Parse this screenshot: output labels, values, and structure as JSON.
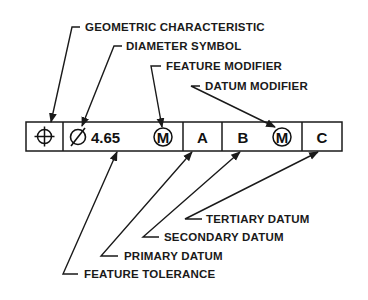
{
  "diagram": {
    "frame": {
      "cells": [
        {
          "id": "geometric-characteristic",
          "symbol": "position-icon",
          "text": ""
        },
        {
          "id": "tolerance",
          "diameter_symbol": "⌀",
          "value": "4.65",
          "modifier": "M"
        },
        {
          "id": "primary-datum",
          "text": "A"
        },
        {
          "id": "secondary-datum",
          "text": "B",
          "modifier": "M"
        },
        {
          "id": "tertiary-datum",
          "text": "C"
        }
      ]
    },
    "labels_top": {
      "geometric_characteristic": "GEOMETRIC CHARACTERISTIC",
      "diameter_symbol": "DIAMETER SYMBOL",
      "feature_modifier": "FEATURE MODIFIER",
      "datum_modifier": "DATUM MODIFIER"
    },
    "labels_bottom": {
      "tertiary_datum": "TERTIARY DATUM",
      "secondary_datum": "SECONDARY DATUM",
      "primary_datum": "PRIMARY DATUM",
      "feature_tolerance": "FEATURE TOLERANCE"
    }
  }
}
